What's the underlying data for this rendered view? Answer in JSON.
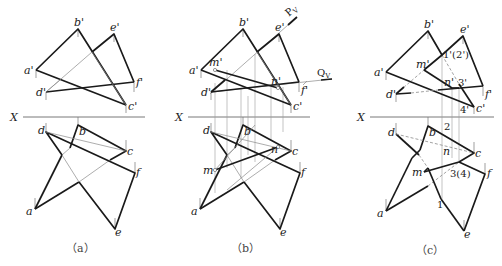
{
  "figure": {
    "axis_label": "X",
    "panels": [
      {
        "id": "a",
        "caption": "（a）",
        "front_labels": {
          "a": "a'",
          "b": "b'",
          "c": "c'",
          "d": "d'",
          "e": "e'",
          "f": "f'"
        },
        "top_labels": {
          "a": "a",
          "b": "b",
          "c": "c",
          "d": "d",
          "e": "e",
          "f": "f"
        }
      },
      {
        "id": "b",
        "caption": "（b）",
        "front_labels": {
          "a": "a'",
          "b": "b'",
          "c": "c'",
          "d": "d'",
          "e": "e'",
          "f": "f'",
          "m": "m'",
          "n": "n'"
        },
        "top_labels": {
          "a": "a",
          "b": "b",
          "c": "c",
          "d": "d",
          "e": "e",
          "f": "f",
          "m": "m",
          "n": "n"
        },
        "plane_labels": {
          "P": "P",
          "P_sub": "V",
          "Q": "Q",
          "Q_sub": "V"
        }
      },
      {
        "id": "c",
        "caption": "（c）",
        "front_labels": {
          "a": "a'",
          "b": "b'",
          "c": "c'",
          "d": "d'",
          "e": "e'",
          "f": "f'",
          "m": "m'",
          "n": "n'",
          "p12": "1'(2')",
          "p3": "3'",
          "p4": "4'"
        },
        "top_labels": {
          "a": "a",
          "b": "b",
          "c": "c",
          "d": "d",
          "e": "e",
          "f": "f",
          "m": "m",
          "n": "n",
          "p1": "1",
          "p2": "2",
          "p34": "3(4)"
        }
      }
    ]
  }
}
